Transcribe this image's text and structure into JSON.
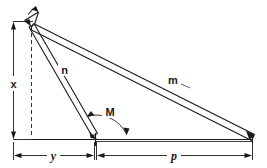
{
  "diagram": {
    "type": "line-drawing",
    "labels": {
      "height_dimension": "x",
      "member_short": "n",
      "member_long": "m",
      "angle": "M",
      "base_left": "y",
      "base_right": "p"
    },
    "colors": {
      "line": "#1a1a1a",
      "background": "#ffffff",
      "text": "#1a1a1a"
    },
    "geometry": {
      "apex": [
        31,
        26
      ],
      "base_left_corner": [
        31,
        139
      ],
      "pivot": [
        95,
        139
      ],
      "base_right_corner": [
        252,
        139
      ],
      "member_n": {
        "from": [
          31,
          26
        ],
        "to": [
          95,
          139
        ]
      },
      "member_m": {
        "from": [
          31,
          26
        ],
        "to": [
          252,
          139
        ]
      },
      "angle_M_degrees": 60
    },
    "annotations": {
      "x_meaning": "vertical height from base to apex",
      "y_meaning": "horizontal distance from base left corner to pivot",
      "p_meaning": "horizontal distance from pivot to base right corner",
      "M_meaning": "angle between member n and the base line"
    }
  }
}
